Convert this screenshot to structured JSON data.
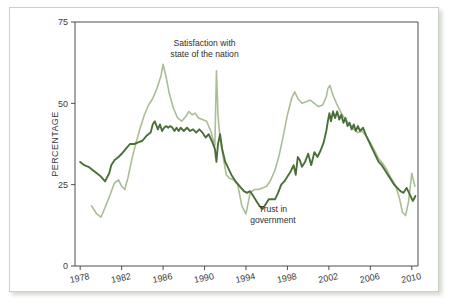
{
  "chart_data": {
    "type": "line",
    "title": "",
    "xlabel": "",
    "ylabel": "PERCENTAGE",
    "xlim": [
      1977.5,
      2010.6
    ],
    "ylim": [
      0,
      75
    ],
    "grid": false,
    "legend_position": "inline-annotation",
    "y_ticks": [
      "0",
      "25",
      "50",
      "75"
    ],
    "y_tick_values": [
      0,
      25,
      50,
      75
    ],
    "x_ticks": [
      "1978",
      "1982",
      "1986",
      "1990",
      "1994",
      "1998",
      "2002",
      "2006",
      "2010"
    ],
    "x_tick_values": [
      1978,
      1982,
      1986,
      1990,
      1994,
      1998,
      2002,
      2006,
      2010
    ],
    "annotations": [
      {
        "name": "satisfaction-label",
        "text_line1": "Satisfaction with",
        "text_line2": "state of the nation",
        "x": 1990.0,
        "y": 67.5
      },
      {
        "name": "trust-label",
        "text_line1": "Trust in",
        "text_line2": "government",
        "x": 1996.6,
        "y": 16.5
      }
    ],
    "series": [
      {
        "name": "Satisfaction with state of the nation",
        "color": "#a9bd96",
        "stroke_width": 1.6,
        "x": [
          1979.1,
          1979.6,
          1980.0,
          1980.4,
          1980.9,
          1981.3,
          1981.7,
          1982.0,
          1982.3,
          1982.6,
          1983.0,
          1983.4,
          1983.8,
          1984.2,
          1984.6,
          1985.0,
          1985.4,
          1985.8,
          1986.0,
          1986.3,
          1986.6,
          1987.0,
          1987.4,
          1987.8,
          1988.2,
          1988.5,
          1988.8,
          1989.1,
          1989.4,
          1989.8,
          1990.2,
          1990.6,
          1991.0,
          1991.15,
          1991.3,
          1991.5,
          1991.8,
          1992.1,
          1992.4,
          1992.8,
          1993.2,
          1993.6,
          1994.0,
          1994.4,
          1994.8,
          1995.2,
          1995.6,
          1996.0,
          1996.4,
          1996.8,
          1997.2,
          1997.6,
          1998.0,
          1998.4,
          1998.7,
          1999.0,
          1999.4,
          1999.8,
          2000.2,
          2000.6,
          2001.0,
          2001.4,
          2001.75,
          2001.9,
          2002.1,
          2002.4,
          2002.8,
          2003.2,
          2003.6,
          2004.0,
          2004.4,
          2004.8,
          2005.2,
          2005.6,
          2006.0,
          2006.4,
          2006.8,
          2007.2,
          2007.6,
          2008.0,
          2008.4,
          2008.8,
          2009.1,
          2009.4,
          2009.7,
          2010.0,
          2010.3
        ],
        "y": [
          18.5,
          16.0,
          15.0,
          18.0,
          22.0,
          25.5,
          26.5,
          24.5,
          23.5,
          27.0,
          33.0,
          38.0,
          42.5,
          46.5,
          49.5,
          51.5,
          54.5,
          58.5,
          62.0,
          58.0,
          53.0,
          48.5,
          45.5,
          44.5,
          46.0,
          47.5,
          46.5,
          47.0,
          45.5,
          45.0,
          44.5,
          41.5,
          37.0,
          60.0,
          46.5,
          39.0,
          33.5,
          28.0,
          27.0,
          26.5,
          25.0,
          18.5,
          16.0,
          22.5,
          23.5,
          23.5,
          24.0,
          24.5,
          26.5,
          29.5,
          34.0,
          40.0,
          46.5,
          51.5,
          53.5,
          51.5,
          50.0,
          50.5,
          51.0,
          50.0,
          49.0,
          49.5,
          52.0,
          54.5,
          55.5,
          52.5,
          49.5,
          47.0,
          45.0,
          43.5,
          42.0,
          41.0,
          41.5,
          40.0,
          38.0,
          35.5,
          33.0,
          31.5,
          29.5,
          27.0,
          25.0,
          21.0,
          16.5,
          15.5,
          20.0,
          28.5,
          24.5
        ]
      },
      {
        "name": "Trust in government",
        "color": "#4a7038",
        "stroke_width": 1.9,
        "x": [
          1978.0,
          1978.4,
          1978.8,
          1979.2,
          1979.6,
          1980.0,
          1980.4,
          1980.8,
          1981.0,
          1981.3,
          1981.7,
          1982.0,
          1982.4,
          1982.8,
          1983.2,
          1983.6,
          1984.0,
          1984.4,
          1984.8,
          1985.0,
          1985.2,
          1985.5,
          1985.7,
          1985.9,
          1986.1,
          1986.3,
          1986.5,
          1986.7,
          1986.9,
          1987.1,
          1987.3,
          1987.5,
          1987.7,
          1988.0,
          1988.3,
          1988.6,
          1988.9,
          1989.2,
          1989.5,
          1989.8,
          1990.1,
          1990.4,
          1990.7,
          1991.0,
          1991.15,
          1991.3,
          1991.5,
          1991.7,
          1992.0,
          1992.3,
          1992.6,
          1993.0,
          1993.4,
          1993.8,
          1994.1,
          1994.4,
          1994.7,
          1995.0,
          1995.3,
          1995.6,
          1995.9,
          1996.2,
          1996.5,
          1996.8,
          1997.1,
          1997.4,
          1997.7,
          1998.0,
          1998.3,
          1998.6,
          1998.8,
          1999.0,
          1999.2,
          1999.4,
          1999.7,
          2000.0,
          2000.3,
          2000.6,
          2000.9,
          2001.2,
          2001.5,
          2001.75,
          2001.9,
          2002.05,
          2002.2,
          2002.4,
          2002.6,
          2002.8,
          2003.0,
          2003.2,
          2003.4,
          2003.6,
          2003.8,
          2004.0,
          2004.2,
          2004.4,
          2004.6,
          2004.8,
          2005.0,
          2005.3,
          2005.6,
          2005.9,
          2006.2,
          2006.5,
          2006.8,
          2007.1,
          2007.4,
          2007.7,
          2008.0,
          2008.3,
          2008.6,
          2008.9,
          2009.2,
          2009.5,
          2009.8,
          2010.1,
          2010.35
        ],
        "y": [
          32.0,
          31.0,
          30.5,
          29.5,
          28.5,
          27.5,
          26.0,
          28.5,
          31.0,
          32.5,
          33.5,
          34.5,
          36.0,
          37.5,
          37.5,
          38.0,
          38.5,
          40.0,
          41.0,
          43.5,
          44.5,
          42.0,
          43.5,
          41.5,
          42.5,
          43.0,
          42.5,
          43.0,
          42.5,
          41.5,
          42.5,
          41.5,
          42.5,
          41.5,
          42.5,
          41.5,
          42.0,
          41.0,
          42.0,
          41.0,
          39.5,
          40.5,
          38.5,
          36.0,
          32.0,
          37.5,
          40.5,
          36.0,
          32.0,
          30.0,
          28.0,
          26.0,
          24.5,
          23.0,
          22.5,
          23.0,
          21.5,
          20.0,
          18.5,
          17.5,
          19.0,
          20.5,
          20.5,
          20.5,
          22.5,
          25.0,
          26.0,
          27.5,
          29.0,
          31.0,
          28.0,
          33.5,
          32.5,
          30.5,
          32.0,
          34.5,
          31.0,
          35.0,
          33.5,
          35.5,
          38.0,
          41.5,
          44.5,
          47.0,
          44.5,
          47.5,
          45.5,
          47.5,
          45.0,
          46.5,
          44.0,
          45.5,
          43.0,
          44.0,
          42.0,
          43.5,
          41.5,
          43.0,
          41.5,
          42.5,
          40.0,
          38.0,
          36.0,
          34.0,
          32.0,
          31.0,
          29.5,
          28.0,
          26.5,
          25.0,
          24.0,
          23.0,
          22.5,
          24.0,
          22.0,
          20.0,
          21.5
        ]
      }
    ]
  }
}
